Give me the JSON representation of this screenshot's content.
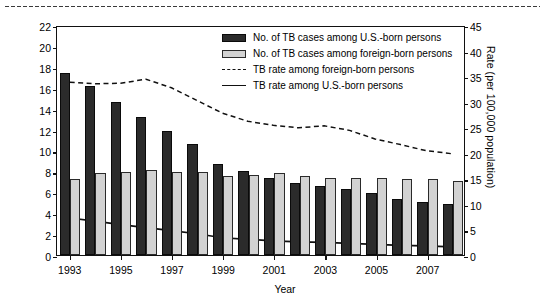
{
  "chart_data": {
    "type": "bar",
    "title": "",
    "xlabel": "Year",
    "ylabel": "Number (in thousands)",
    "ylabel_right": "Rate (per 100,000 population)",
    "x": [
      1993,
      1994,
      1995,
      1996,
      1997,
      1998,
      1999,
      2000,
      2001,
      2002,
      2003,
      2004,
      2005,
      2006,
      2007,
      2008
    ],
    "categories": [
      "1993",
      "1994",
      "1995",
      "1996",
      "1997",
      "1998",
      "1999",
      "2000",
      "2001",
      "2002",
      "2003",
      "2004",
      "2005",
      "2006",
      "2007",
      "2008"
    ],
    "xtick_labels": [
      "1993",
      "1995",
      "1997",
      "1999",
      "2001",
      "2003",
      "2005",
      "2007"
    ],
    "xtick_values": [
      1993,
      1995,
      1997,
      1999,
      2001,
      2003,
      2005,
      2007
    ],
    "ylim": [
      0,
      22
    ],
    "yticks": [
      0,
      2,
      4,
      6,
      8,
      10,
      12,
      14,
      16,
      18,
      20,
      22
    ],
    "ylim_right": [
      0,
      45
    ],
    "yticks_right": [
      0,
      5,
      10,
      15,
      20,
      25,
      30,
      35,
      40,
      45
    ],
    "grid": false,
    "legend_position": "top-right",
    "series": [
      {
        "name": "No. of TB cases among U.S.-born persons",
        "kind": "bar",
        "axis": "left",
        "color": "#2b2b2b",
        "values": [
          17.4,
          16.2,
          14.6,
          13.2,
          11.9,
          10.6,
          8.7,
          8.0,
          7.4,
          6.9,
          6.6,
          6.3,
          5.9,
          5.4,
          5.1,
          4.9
        ]
      },
      {
        "name": "No. of TB cases among foreign-born persons",
        "kind": "bar",
        "axis": "left",
        "color": "#d2d2d2",
        "values": [
          7.3,
          7.8,
          7.9,
          8.1,
          7.9,
          7.9,
          7.6,
          7.7,
          7.8,
          7.6,
          7.4,
          7.4,
          7.4,
          7.3,
          7.3,
          7.1
        ]
      },
      {
        "name": "TB rate among foreign-born persons",
        "kind": "line",
        "style": "dashed",
        "axis": "right",
        "color": "#111111",
        "values": [
          34.1,
          33.8,
          33.9,
          34.7,
          33.0,
          30.5,
          28.0,
          26.4,
          25.6,
          25.1,
          25.5,
          24.6,
          22.9,
          21.8,
          20.6,
          20.0
        ]
      },
      {
        "name": "TB rate among U.S.-born persons",
        "kind": "line",
        "style": "solid",
        "axis": "right",
        "color": "#111111",
        "values": [
          7.3,
          6.7,
          6.0,
          5.4,
          4.8,
          4.2,
          3.4,
          3.1,
          2.8,
          2.6,
          2.5,
          2.3,
          2.1,
          1.9,
          1.8,
          1.6
        ]
      }
    ]
  },
  "legend": {
    "items": [
      {
        "label": "No. of TB cases among U.S.-born persons",
        "marker": "dark-swatch"
      },
      {
        "label": "No. of TB cases among foreign-born persons",
        "marker": "light-swatch"
      },
      {
        "label": "TB rate among foreign-born persons",
        "marker": "dashed-line"
      },
      {
        "label": "TB rate among U.S.-born persons",
        "marker": "solid-line"
      }
    ]
  }
}
